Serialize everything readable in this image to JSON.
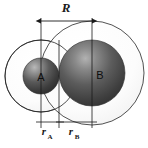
{
  "figure": {
    "background_color": "#ffffff",
    "line_color": "#1a1a1a",
    "sphere_dark": "#3d3d3d",
    "sphere_mid": "#545454",
    "sphere_highlight": "#b9b9b9",
    "shell_fill": "#fbfbfb"
  },
  "spheres": {
    "a": {
      "label": "A",
      "center_x": 41,
      "center_y": 76,
      "core_radius": 18,
      "shell_radius": 36
    },
    "b": {
      "label": "B",
      "center_x": 92,
      "center_y": 73,
      "core_radius": 33,
      "shell_radius": 52
    }
  },
  "dimensions": {
    "separation": {
      "label": "R",
      "subscript": "",
      "from_x": 41,
      "to_x": 92,
      "y": 21
    },
    "radius_a": {
      "label": "r",
      "subscript": "A",
      "from_x": 41,
      "to_x": 59,
      "y": 124
    },
    "radius_b": {
      "label": "r",
      "subscript": "B",
      "from_x": 59,
      "to_x": 92,
      "y": 124
    }
  },
  "guide_lines": [
    {
      "name": "center-a",
      "x": 41
    },
    {
      "name": "contact-point",
      "x": 59
    },
    {
      "name": "center-b",
      "x": 92
    }
  ]
}
